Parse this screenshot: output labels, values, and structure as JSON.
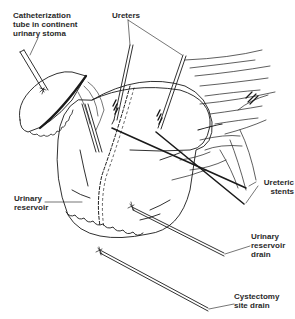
{
  "figure": {
    "type": "surgical line illustration",
    "stroke_color": "#1a1a1a",
    "background": "#ffffff"
  },
  "labels": {
    "catheterization_tube": "Catheterization\ntube in continent\nurinary stoma",
    "ureters": "Ureters",
    "ureteric_stents": "Ureteric\nstents",
    "urinary_reservoir": "Urinary\nreservoir",
    "urinary_reservoir_drain": "Urinary\nreservoir\ndrain",
    "cystectomy_site_drain": "Cystectomy\nsite drain"
  }
}
